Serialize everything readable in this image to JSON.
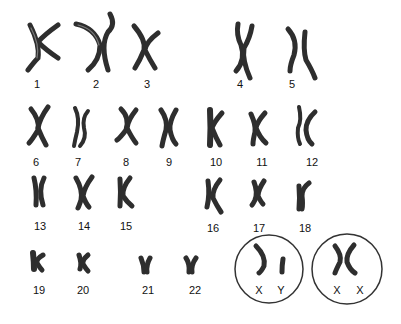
{
  "chromosomes": [
    {
      "label": "1"
    },
    {
      "label": "2"
    },
    {
      "label": "3"
    },
    {
      "label": "4"
    },
    {
      "label": "5"
    },
    {
      "label": "6"
    },
    {
      "label": "7"
    },
    {
      "label": "8"
    },
    {
      "label": "9"
    },
    {
      "label": "10"
    },
    {
      "label": "11"
    },
    {
      "label": "12"
    },
    {
      "label": "13"
    },
    {
      "label": "14"
    },
    {
      "label": "15"
    },
    {
      "label": "16"
    },
    {
      "label": "17"
    },
    {
      "label": "18"
    },
    {
      "label": "19"
    },
    {
      "label": "20"
    },
    {
      "label": "21"
    },
    {
      "label": "22"
    }
  ],
  "sex_chromosomes": {
    "male": {
      "labels": [
        "X",
        "Y"
      ]
    },
    "female": {
      "labels": [
        "X",
        "X"
      ]
    }
  },
  "colors": {
    "chromosome": "#2e2e2e",
    "label": "#111111",
    "circle": "#333333"
  }
}
